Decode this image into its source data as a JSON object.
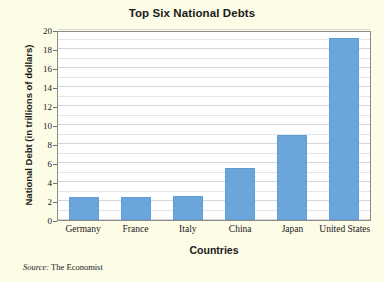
{
  "chart_data": {
    "type": "bar",
    "title": "Top Six National Debts",
    "xlabel": "Countries",
    "ylabel": "National Debt (in trillions of dollars)",
    "categories": [
      "Germany",
      "France",
      "Italy",
      "China",
      "Japan",
      "United States"
    ],
    "values": [
      2.4,
      2.4,
      2.5,
      5.5,
      9.0,
      19.2
    ],
    "ylim": [
      0,
      20
    ],
    "ytick_labels": [
      "0",
      "2",
      "4",
      "6",
      "8",
      "10",
      "12",
      "14",
      "16",
      "18",
      "20"
    ],
    "ytick_values": [
      0,
      2,
      4,
      6,
      8,
      10,
      12,
      14,
      16,
      18,
      20
    ],
    "grid": true,
    "minor_grid": true,
    "legend": "none",
    "bar_color": "#6aa6db",
    "background_color": "#fdfce6",
    "plot_background_color": "#ffffff",
    "gridline_color": "#e2e5ea",
    "axis_color": "#8c8c84"
  },
  "source": {
    "prefix": "Source:",
    "text": " The Economist"
  }
}
